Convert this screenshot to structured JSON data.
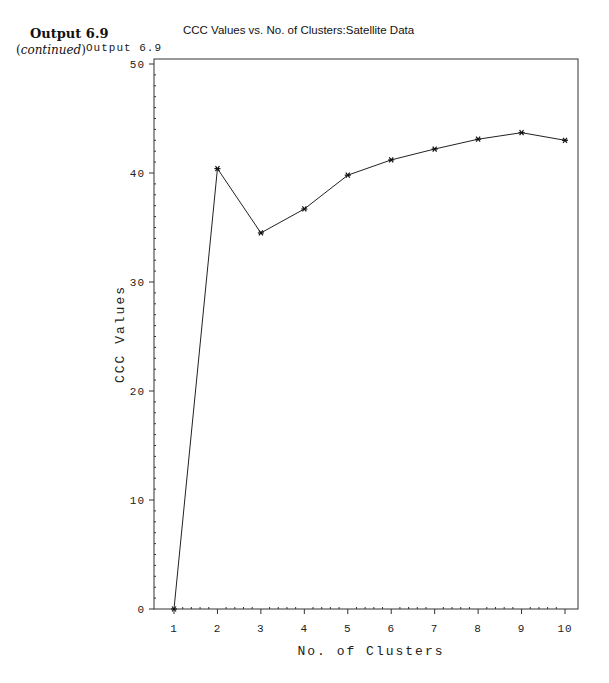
{
  "caption": {
    "title": "Output 6.9",
    "subtitle_open": "(",
    "subtitle_italic": "continued",
    "subtitle_close": ")"
  },
  "output_label": "Output 6.9",
  "chart_data": {
    "type": "line",
    "title": "CCC Values vs. No. of Clusters:Satellite Data",
    "xlabel": "No. of Clusters",
    "ylabel": "CCC Values",
    "x": [
      1,
      2,
      3,
      4,
      5,
      6,
      7,
      8,
      9,
      10
    ],
    "series": [
      {
        "name": "CCC",
        "marker": "*",
        "values": [
          0,
          40.4,
          34.5,
          36.7,
          39.8,
          41.2,
          42.2,
          43.1,
          43.7,
          43.0
        ]
      }
    ],
    "xlim": [
      0.6,
      10.3
    ],
    "ylim": [
      0,
      50
    ],
    "xticks": [
      1,
      2,
      3,
      4,
      5,
      6,
      7,
      8,
      9,
      10
    ],
    "yticks": [
      0,
      10,
      20,
      30,
      40,
      50
    ],
    "grid": false,
    "legend": null
  }
}
